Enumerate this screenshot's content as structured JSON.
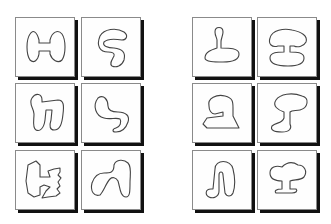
{
  "figure": {
    "groups": [
      {
        "name": "left-group",
        "panels": [
          {
            "id": "L1",
            "label": "h-shape"
          },
          {
            "id": "L2",
            "label": "s-curl-shape"
          },
          {
            "id": "L3",
            "label": "n-loop-shape"
          },
          {
            "id": "L4",
            "label": "hook-shape"
          },
          {
            "id": "L5",
            "label": "jagged-h-shape"
          },
          {
            "id": "L6",
            "label": "blob-n-shape"
          }
        ]
      },
      {
        "name": "right-group",
        "panels": [
          {
            "id": "R1",
            "label": "keyhole-shape"
          },
          {
            "id": "R2",
            "label": "mushroom-shape"
          },
          {
            "id": "R3",
            "label": "boot-shape"
          },
          {
            "id": "R4",
            "label": "goblet-shape"
          },
          {
            "id": "R5",
            "label": "inverted-u-shape"
          },
          {
            "id": "R6",
            "label": "tree-shape"
          }
        ]
      }
    ],
    "colors": {
      "border": "#8a8a8a",
      "shadow": "#111111",
      "stroke": "#444444",
      "background": "#ffffff"
    }
  }
}
